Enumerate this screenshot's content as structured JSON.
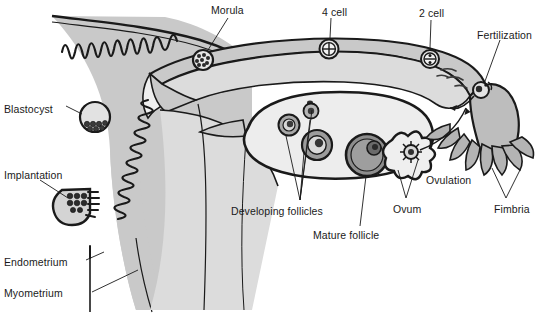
{
  "diagram": {
    "type": "anatomical-illustration",
    "canvas": {
      "width": 539,
      "height": 335
    },
    "palette": {
      "background": "#ffffff",
      "tissue_fill": "#c9c9c9",
      "lumen_fill": "#efefef",
      "ovary_fill": "#ededed",
      "follicle_mid": "#9a9a9a",
      "follicle_dark": "#6f6f6f",
      "outline": "#1a1a1a",
      "label_text": "#1a1a1a",
      "leader_line": "#1a1a1a"
    },
    "labels": [
      {
        "id": "morula",
        "text": "Morula",
        "x": 211,
        "y": 4,
        "anchor": "start"
      },
      {
        "id": "four-cell",
        "text": "4 cell",
        "x": 322,
        "y": 6,
        "anchor": "start"
      },
      {
        "id": "two-cell",
        "text": "2 cell",
        "x": 419,
        "y": 7,
        "anchor": "start"
      },
      {
        "id": "fertilization",
        "text": "Fertilization",
        "x": 477,
        "y": 29,
        "anchor": "start"
      },
      {
        "id": "blastocyst",
        "text": "Blastocyst",
        "x": 4,
        "y": 103,
        "anchor": "start"
      },
      {
        "id": "implantation",
        "text": "Implantation",
        "x": 4,
        "y": 169,
        "anchor": "start"
      },
      {
        "id": "ovulation",
        "text": "Ovulation",
        "x": 426,
        "y": 174,
        "anchor": "start"
      },
      {
        "id": "ovum",
        "text": "Ovum",
        "x": 393,
        "y": 203,
        "anchor": "start"
      },
      {
        "id": "fimbria",
        "text": "Fimbria",
        "x": 494,
        "y": 203,
        "anchor": "start"
      },
      {
        "id": "developing-follicles",
        "text": "Developing follicles",
        "x": 231,
        "y": 205,
        "anchor": "start"
      },
      {
        "id": "mature-follicle",
        "text": "Mature follicle",
        "x": 313,
        "y": 229,
        "anchor": "start"
      },
      {
        "id": "endometrium",
        "text": "Endometrium",
        "x": 4,
        "y": 256,
        "anchor": "start"
      },
      {
        "id": "myometrium",
        "text": "Myometrium",
        "x": 4,
        "y": 287,
        "anchor": "start"
      }
    ],
    "structures": [
      {
        "id": "uterus",
        "name": "Uterus body"
      },
      {
        "id": "uterine-cavity",
        "name": "Uterine cavity"
      },
      {
        "id": "endometrium-layer",
        "name": "Endometrium (convoluted lining)"
      },
      {
        "id": "myometrium-layer",
        "name": "Myometrium (muscular wall)"
      },
      {
        "id": "fallopian-tube",
        "name": "Fallopian tube / oviduct"
      },
      {
        "id": "ovary",
        "name": "Ovary"
      },
      {
        "id": "broad-ligament",
        "name": "Broad ligament"
      },
      {
        "id": "infundibulum",
        "name": "Infundibulum with fimbria"
      }
    ],
    "stages": [
      {
        "id": "stage-ovulation",
        "name": "Ovulation",
        "cx": 411,
        "cy": 152,
        "r": 7.5,
        "style": "corona-radiata"
      },
      {
        "id": "stage-fertilization",
        "name": "Fertilization",
        "cx": 481,
        "cy": 90,
        "r": 8.0,
        "style": "sperm-and-ovum"
      },
      {
        "id": "stage-2cell",
        "name": "2 cell",
        "cx": 430,
        "cy": 59,
        "r": 9.0,
        "style": "two-cell"
      },
      {
        "id": "stage-4cell",
        "name": "4 cell",
        "cx": 329,
        "cy": 49,
        "r": 9.5,
        "style": "four-cell"
      },
      {
        "id": "stage-morula",
        "name": "Morula",
        "cx": 203,
        "cy": 60,
        "r": 10.0,
        "style": "mulberry-cluster"
      },
      {
        "id": "stage-blastocyst",
        "name": "Blastocyst",
        "cx": 95,
        "cy": 117,
        "r": 15.0,
        "style": "inner-cell-mass"
      },
      {
        "id": "stage-implantation",
        "name": "Implantation",
        "cx": 76,
        "cy": 203,
        "r": 15.0,
        "style": "embedded-in-endometrium"
      }
    ],
    "follicles": [
      {
        "id": "primordial-follicle",
        "cx": 310,
        "cy": 103,
        "r": 2.6,
        "kind": "primordial"
      },
      {
        "id": "primary-follicle",
        "cx": 311,
        "cy": 111,
        "r": 7.5,
        "kind": "primary"
      },
      {
        "id": "secondary-follicle",
        "cx": 289,
        "cy": 125,
        "r": 10.5,
        "kind": "secondary"
      },
      {
        "id": "tertiary-follicle",
        "cx": 317,
        "cy": 145,
        "r": 15.0,
        "kind": "tertiary"
      },
      {
        "id": "mature-follicle",
        "cx": 367,
        "cy": 155,
        "r": 21.0,
        "kind": "graafian"
      }
    ]
  }
}
